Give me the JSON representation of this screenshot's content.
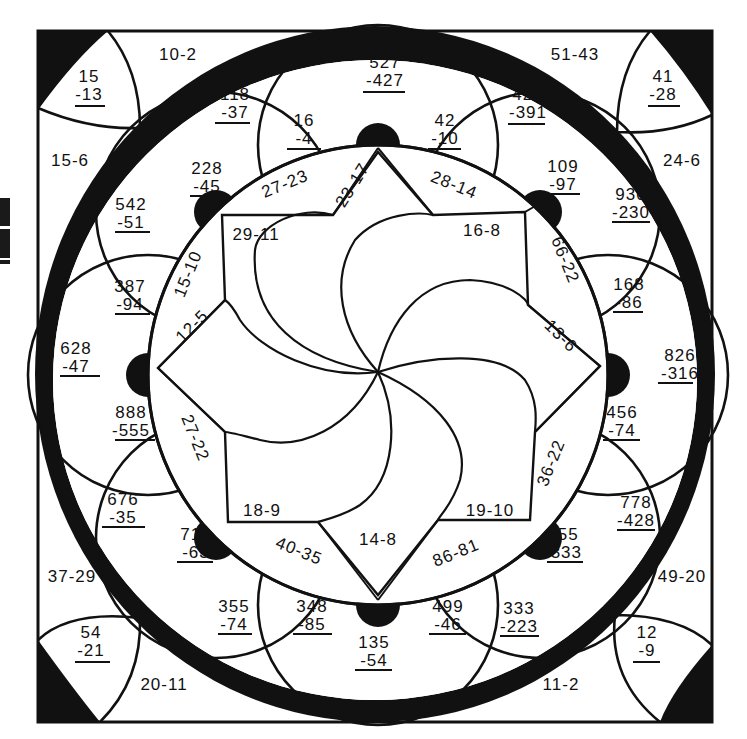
{
  "worksheet": {
    "type": "subtraction color-by-number mandala",
    "ink_color": "#111111",
    "paper_color": "#ffffff"
  },
  "corners": {
    "top_left": {
      "top": "15",
      "bottom": "-13"
    },
    "top_right": {
      "top": "41",
      "bottom": "-28"
    },
    "bottom_left": {
      "top": "54",
      "bottom": "-21"
    },
    "bottom_right": {
      "top": "12",
      "bottom": "-9"
    }
  },
  "outer_border_problems": {
    "top_left_upper": "10-2",
    "top_left_lower": "15-6",
    "top_right_upper": "51-43",
    "top_right_lower": "24-6",
    "bottom_left_upper": "37-29",
    "bottom_left_lower": "20-11",
    "bottom_right_upper": "49-20",
    "bottom_right_lower": "11-2"
  },
  "petal_problems": [
    {
      "top": "527",
      "bottom": "-427"
    },
    {
      "top": "16",
      "bottom": "-4"
    },
    {
      "top": "42",
      "bottom": "-10"
    },
    {
      "top": "118",
      "bottom": "-37"
    },
    {
      "top": "421",
      "bottom": "-391"
    },
    {
      "top": "228",
      "bottom": "-45"
    },
    {
      "top": "109",
      "bottom": "-97"
    },
    {
      "top": "542",
      "bottom": "-51"
    },
    {
      "top": "930",
      "bottom": "-230"
    },
    {
      "top": "387",
      "bottom": "-94"
    },
    {
      "top": "168",
      "bottom": "-86"
    },
    {
      "top": "628",
      "bottom": "-47"
    },
    {
      "top": "826",
      "bottom": "-316"
    },
    {
      "top": "888",
      "bottom": "-555"
    },
    {
      "top": "456",
      "bottom": "-74"
    },
    {
      "top": "676",
      "bottom": "-35"
    },
    {
      "top": "778",
      "bottom": "-428"
    },
    {
      "top": "716",
      "bottom": "-63"
    },
    {
      "top": "555",
      "bottom": "-333"
    },
    {
      "top": "355",
      "bottom": "-74"
    },
    {
      "top": "348",
      "bottom": "-85"
    },
    {
      "top": "499",
      "bottom": "-46"
    },
    {
      "top": "333",
      "bottom": "-223"
    },
    {
      "top": "135",
      "bottom": "-54"
    }
  ],
  "ring_problems": [
    "27-23",
    "23-17",
    "28-14",
    "66-22",
    "13-6",
    "36-22",
    "86-81",
    "14-8",
    "40-35",
    "27-22",
    "12-5",
    "15-10"
  ],
  "inner_problems": [
    "29-11",
    "16-8",
    "19-10",
    "18-9"
  ]
}
